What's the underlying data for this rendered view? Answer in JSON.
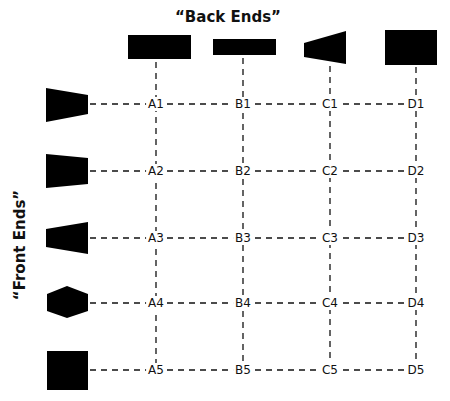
{
  "titles": {
    "back_ends": "“Back Ends”",
    "front_ends": "“Front Ends”"
  },
  "colors": {
    "shape_fill": "#000000",
    "line": "#111111",
    "background": "#ffffff"
  },
  "back_ends": [
    {
      "id": "A",
      "shape": "wide-rectangle",
      "x": 156
    },
    {
      "id": "B",
      "shape": "thin-rectangle",
      "x": 243
    },
    {
      "id": "C",
      "shape": "flared-trapezoid",
      "x": 330
    },
    {
      "id": "D",
      "shape": "large-square",
      "x": 416
    }
  ],
  "front_ends": [
    {
      "id": "1",
      "shape": "tapered-trapezoid",
      "y": 104
    },
    {
      "id": "2",
      "shape": "slight-taper-trapezoid",
      "y": 171
    },
    {
      "id": "3",
      "shape": "reverse-trapezoid",
      "y": 238
    },
    {
      "id": "4",
      "shape": "hexagon",
      "y": 303
    },
    {
      "id": "5",
      "shape": "square",
      "y": 370
    }
  ],
  "grid": {
    "rows": [
      [
        "A1",
        "B1",
        "C1",
        "D1"
      ],
      [
        "A2",
        "B2",
        "C2",
        "D2"
      ],
      [
        "A3",
        "B3",
        "C3",
        "D3"
      ],
      [
        "A4",
        "B4",
        "C4",
        "D4"
      ],
      [
        "A5",
        "B5",
        "C5",
        "D5"
      ]
    ]
  }
}
